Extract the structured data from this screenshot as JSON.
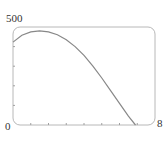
{
  "chart_data": {
    "type": "line",
    "title": "",
    "xlabel": "",
    "ylabel": "",
    "xlim": [
      0,
      8
    ],
    "ylim": [
      0,
      500
    ],
    "x_tick_labels": [
      "0",
      "8"
    ],
    "y_tick_labels": [
      "0",
      "500"
    ],
    "x_minor_ticks": [
      1,
      2,
      3,
      4,
      5,
      6,
      7
    ],
    "y_minor_ticks": [
      100,
      200,
      300,
      400
    ],
    "grid": false,
    "legend": null,
    "series": [
      {
        "name": "curve",
        "x": [
          0,
          0.5,
          1,
          1.5,
          2,
          2.5,
          3,
          3.5,
          4,
          4.5,
          5,
          5.5,
          6,
          6.5,
          6.9
        ],
        "y": [
          423,
          458,
          475,
          480,
          475,
          460,
          435,
          400,
          355,
          300,
          240,
          175,
          110,
          45,
          0
        ]
      }
    ],
    "colors": {
      "curve": "#888888",
      "frame": "#b0b0b0"
    }
  },
  "labels": {
    "y_max": "500",
    "origin": "0",
    "x_max": "8"
  }
}
